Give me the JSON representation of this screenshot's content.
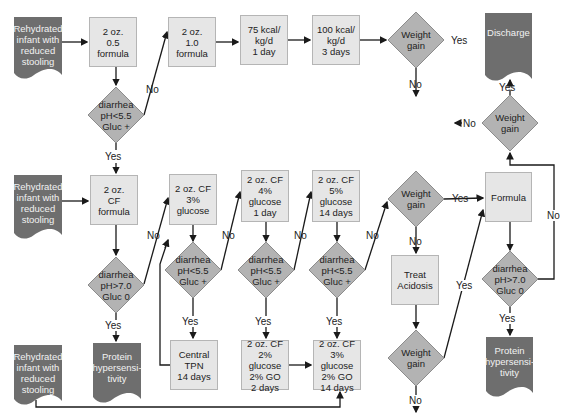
{
  "colors": {
    "box_fill": "#e6e6e6",
    "box_border": "#b5b5b5",
    "diamond_fill": "#b3b3b3",
    "doc_fill": "#6e6e6e",
    "arrow": "#1a1a1a"
  },
  "nodes": {
    "start1": [
      "Rehydrated",
      "infant with",
      "reduced",
      "stooling"
    ],
    "f05": [
      "2 oz.",
      "0.5 formula"
    ],
    "f10": [
      "2 oz.",
      "1.0 formula"
    ],
    "kcal75": [
      "75 kcal/",
      "kg/d",
      "1 day"
    ],
    "kcal100": [
      "100 kcal/",
      "kg/d",
      "3 days"
    ],
    "wg1": [
      "Weight",
      "gain"
    ],
    "discharge": [
      "Discharge"
    ],
    "d1": [
      "diarrhea",
      "pH<5.5",
      "Gluc +"
    ],
    "wg_top_right": [
      "Weight",
      "gain"
    ],
    "start2": [
      "Rehydrated",
      "infant with",
      "reduced",
      "stooling"
    ],
    "cf": [
      "2 oz.",
      "CF formula"
    ],
    "cf3": [
      "2 oz. CF",
      "3% glucose"
    ],
    "cf4": [
      "2 oz. CF",
      "4% glucose",
      "1 day"
    ],
    "cf5": [
      "2 oz. CF",
      "5% glucose",
      "14 days"
    ],
    "wg2": [
      "Weight",
      "gain"
    ],
    "formula": [
      "Formula"
    ],
    "d2": [
      "diarrhea",
      "pH>7.0",
      "Gluc 0"
    ],
    "d3": [
      "diarrhea",
      "pH<5.5",
      "Gluc +"
    ],
    "d4": [
      "diarrhea",
      "pH<5.5",
      "Gluc +"
    ],
    "d5": [
      "diarrhea",
      "pH<5.5",
      "Gluc +"
    ],
    "d6": [
      "diarrhea",
      "pH>7.0",
      "Gluc 0"
    ],
    "acidosis": [
      "Treat",
      "Acidosis"
    ],
    "wg3": [
      "Weight",
      "gain"
    ],
    "start3": [
      "Rehydrated",
      "infant with",
      "reduced",
      "stooling"
    ],
    "protein1": [
      "Protein",
      "hypersensi-",
      "tivity"
    ],
    "tpn": [
      "Central",
      "TPN",
      "14 days"
    ],
    "go2": [
      "2 oz. CF",
      "2% glucose",
      "2% GO",
      "2 days"
    ],
    "go3": [
      "2 oz. CF",
      "3% glucose",
      "2% GO",
      "14 days"
    ],
    "protein2": [
      "Protein",
      "hypersensi-",
      "tivity"
    ]
  },
  "labels": {
    "yes": "Yes",
    "no": "No",
    "no_left": "←No-",
    "yes_right": "-Yes →"
  }
}
